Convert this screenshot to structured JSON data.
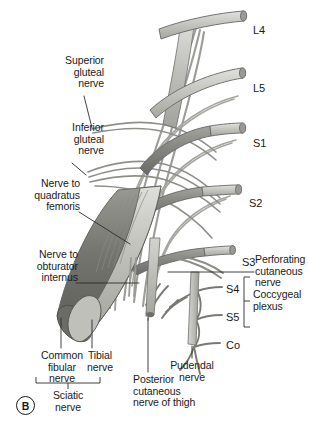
{
  "figure": {
    "panel_letter": "B",
    "caption_subject": "sacral plexus",
    "background_color": "#ffffff",
    "ink_color": "#1a1a1a",
    "nerve_light_color": "#c9c9c4",
    "nerve_mid_color": "#a8a8a2",
    "nerve_dark_color": "#7d7d78",
    "nerve_darkest_color": "#5e5e5a",
    "outline_color": "#55555a"
  },
  "left_labels": [
    {
      "id": "superior-gluteal-nerve",
      "text": "Superior\ngluteal\nnerve"
    },
    {
      "id": "inferior-gluteal-nerve",
      "text": "Inferior\ngluteal\nnerve"
    },
    {
      "id": "nerve-to-quadratus-femoris",
      "text": "Nerve to\nquadratus\nfemoris"
    },
    {
      "id": "nerve-to-obturator-internus",
      "text": "Nerve to\nobturator\ninternus"
    },
    {
      "id": "common-fibular-nerve",
      "text": "Common\nfibular\nnerve"
    },
    {
      "id": "tibial-nerve",
      "text": "Tibial\nnerve"
    },
    {
      "id": "sciatic-nerve",
      "text": "Sciatic\nnerve"
    }
  ],
  "bottom_labels": [
    {
      "id": "pudendal-nerve",
      "text": "Pudendal\nnerve"
    },
    {
      "id": "posterior-cutaneous-nerve-of-thigh",
      "text": "Posterior\ncutaneous\nnerve of thigh"
    }
  ],
  "right_labels": [
    {
      "id": "perforating-cutaneous-nerve",
      "text": "Perforating\ncutaneous\nnerve"
    },
    {
      "id": "coccygeal-plexus",
      "text": "Coccygeal\nplexus"
    }
  ],
  "spinal_roots": [
    {
      "id": "L4",
      "label": "L4"
    },
    {
      "id": "L5",
      "label": "L5"
    },
    {
      "id": "S1",
      "label": "S1"
    },
    {
      "id": "S2",
      "label": "S2"
    },
    {
      "id": "S3",
      "label": "S3"
    },
    {
      "id": "S4",
      "label": "S4"
    },
    {
      "id": "S5",
      "label": "S5"
    },
    {
      "id": "Co",
      "label": "Co"
    }
  ]
}
